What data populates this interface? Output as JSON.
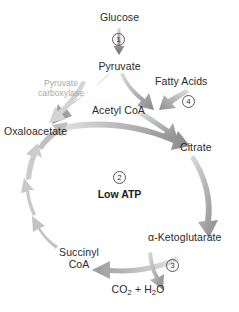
{
  "diagram": {
    "type": "cycle-flow-diagram",
    "colors": {
      "text": "#2b2b2b",
      "enzyme_text": "#a9a9a9",
      "arrow_dark": "#6e6e6e",
      "arrow_light": "#bdbdbd",
      "background": "#ffffff"
    },
    "nodes": [
      {
        "id": "glucose",
        "label": "Glucose"
      },
      {
        "id": "pyruvate",
        "label": "Pyruvate"
      },
      {
        "id": "fatty_acids",
        "label": "Fatty Acids"
      },
      {
        "id": "acetyl_coa",
        "label": "Acetyl CoA"
      },
      {
        "id": "oxaloacetate",
        "label": "Oxaloacetate"
      },
      {
        "id": "citrate",
        "label": "Citrate"
      },
      {
        "id": "ketoglutarate",
        "label": "α-Ketoglutarate"
      },
      {
        "id": "succinyl_coa_1",
        "label": "Succinyl"
      },
      {
        "id": "succinyl_coa_2",
        "label": "CoA"
      },
      {
        "id": "co2_h2o_a",
        "label": "CO"
      },
      {
        "id": "co2_h2o_b",
        "label": "2"
      },
      {
        "id": "co2_h2o_c",
        "label": " + H"
      },
      {
        "id": "co2_h2o_d",
        "label": "2"
      },
      {
        "id": "co2_h2o_e",
        "label": "O"
      }
    ],
    "enzyme_label": {
      "line1": "Pyruvate",
      "line2": "carboxylase"
    },
    "center_label": "Low ATP",
    "steps": [
      {
        "id": "step-1",
        "number": "1"
      },
      {
        "id": "step-2",
        "number": "2"
      },
      {
        "id": "step-3",
        "number": "3"
      },
      {
        "id": "step-4",
        "number": "4"
      }
    ]
  }
}
